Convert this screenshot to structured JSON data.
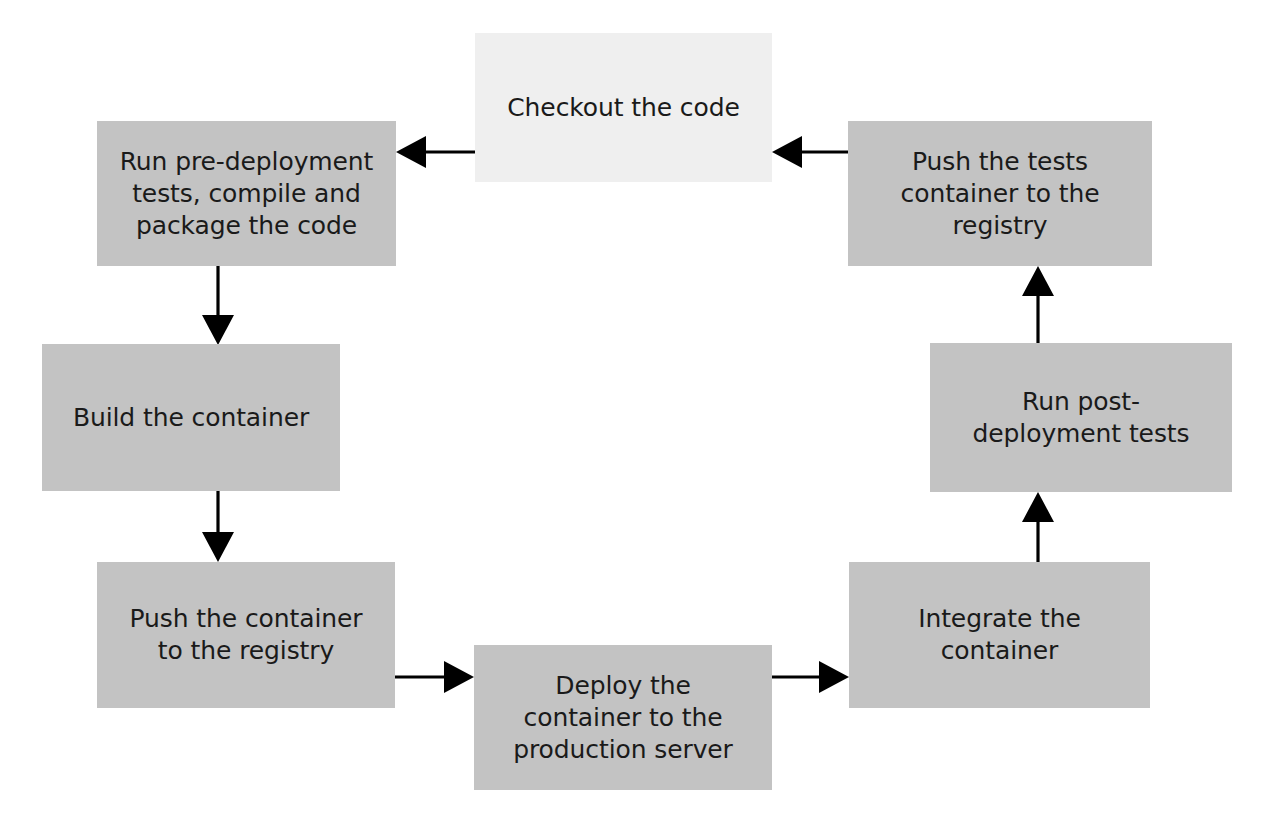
{
  "diagram": {
    "type": "flowchart-cycle",
    "canvas": {
      "width": 1268,
      "height": 826
    },
    "colors": {
      "box_fill_default": "#c3c3c3",
      "box_fill_highlight": "#efefef",
      "text": "#1a1a1a",
      "edge": "#000000",
      "background": "#ffffff"
    },
    "nodes": [
      {
        "id": "checkout",
        "label": "Checkout the code",
        "x": 475,
        "y": 33,
        "w": 297,
        "h": 149,
        "fill": "#efefef"
      },
      {
        "id": "pre-deployment",
        "label": "Run pre-deployment\ntests, compile and\npackage the code",
        "x": 97,
        "y": 121,
        "w": 299,
        "h": 145,
        "fill": "#c3c3c3"
      },
      {
        "id": "build-container",
        "label": "Build the container",
        "x": 42,
        "y": 344,
        "w": 298,
        "h": 147,
        "fill": "#c3c3c3"
      },
      {
        "id": "push-container",
        "label": "Push the container\nto the registry",
        "x": 97,
        "y": 562,
        "w": 298,
        "h": 146,
        "fill": "#c3c3c3"
      },
      {
        "id": "deploy-container",
        "label": "Deploy the\ncontainer to the\nproduction server",
        "x": 474,
        "y": 645,
        "w": 298,
        "h": 145,
        "fill": "#c3c3c3"
      },
      {
        "id": "integrate-container",
        "label": "Integrate the\ncontainer",
        "x": 849,
        "y": 562,
        "w": 301,
        "h": 146,
        "fill": "#c3c3c3"
      },
      {
        "id": "post-deployment",
        "label": "Run post-\ndeployment tests",
        "x": 930,
        "y": 343,
        "w": 302,
        "h": 149,
        "fill": "#c3c3c3"
      },
      {
        "id": "push-tests",
        "label": "Push the tests\ncontainer to the\nregistry",
        "x": 848,
        "y": 121,
        "w": 304,
        "h": 145,
        "fill": "#c3c3c3"
      }
    ],
    "edges": [
      {
        "id": "edge-checkout-to-pre-deployment",
        "from": "checkout",
        "to": "pre-deployment",
        "direction": "left",
        "x1": 475,
        "y1": 152,
        "x2": 396,
        "y2": 152
      },
      {
        "id": "edge-pre-deployment-to-build",
        "from": "pre-deployment",
        "to": "build-container",
        "direction": "down",
        "x1": 218,
        "y1": 266,
        "x2": 218,
        "y2": 345
      },
      {
        "id": "edge-build-to-push-container",
        "from": "build-container",
        "to": "push-container",
        "direction": "down",
        "x1": 218,
        "y1": 491,
        "x2": 218,
        "y2": 562
      },
      {
        "id": "edge-push-container-to-deploy",
        "from": "push-container",
        "to": "deploy-container",
        "direction": "right",
        "x1": 395,
        "y1": 677,
        "x2": 474,
        "y2": 677
      },
      {
        "id": "edge-deploy-to-integrate",
        "from": "deploy-container",
        "to": "integrate-container",
        "direction": "right",
        "x1": 772,
        "y1": 677,
        "x2": 849,
        "y2": 677
      },
      {
        "id": "edge-integrate-to-post-deployment",
        "from": "integrate-container",
        "to": "post-deployment",
        "direction": "up",
        "x1": 1038,
        "y1": 562,
        "x2": 1038,
        "y2": 492
      },
      {
        "id": "edge-post-deployment-to-push-tests",
        "from": "post-deployment",
        "to": "push-tests",
        "direction": "up",
        "x1": 1038,
        "y1": 343,
        "x2": 1038,
        "y2": 266
      },
      {
        "id": "edge-push-tests-to-checkout",
        "from": "push-tests",
        "to": "checkout",
        "direction": "left",
        "x1": 848,
        "y1": 152,
        "x2": 772,
        "y2": 152
      }
    ]
  }
}
